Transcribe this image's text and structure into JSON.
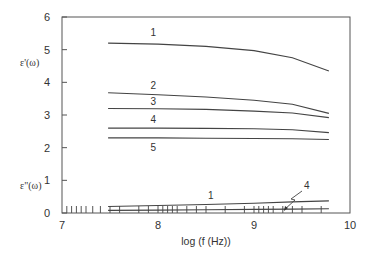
{
  "chart_data": {
    "type": "line",
    "title": "",
    "xlabel": "log (f (Hz))",
    "ylabel_real": "ε'(ω)",
    "ylabel_imag": "ε\"(ω)",
    "xlim": [
      7,
      10
    ],
    "ylim": [
      0,
      6
    ],
    "x_ticks": [
      "7",
      "8",
      "9",
      "10"
    ],
    "y_ticks": [
      "0",
      "1",
      "2",
      "3",
      "4",
      "5",
      "6"
    ],
    "grid": false,
    "legend": "inline curve labels",
    "x": [
      7.48,
      8.0,
      8.5,
      9.0,
      9.4,
      9.78
    ],
    "series": [
      {
        "name": "1",
        "part": "real",
        "values": [
          5.2,
          5.17,
          5.1,
          4.97,
          4.75,
          4.35
        ]
      },
      {
        "name": "2",
        "part": "real",
        "values": [
          3.68,
          3.62,
          3.55,
          3.45,
          3.33,
          3.05
        ]
      },
      {
        "name": "3",
        "part": "real",
        "values": [
          3.2,
          3.19,
          3.17,
          3.12,
          3.06,
          2.92
        ]
      },
      {
        "name": "4",
        "part": "real",
        "values": [
          2.6,
          2.6,
          2.59,
          2.58,
          2.55,
          2.46
        ]
      },
      {
        "name": "5",
        "part": "real",
        "values": [
          2.3,
          2.3,
          2.29,
          2.28,
          2.27,
          2.25
        ]
      },
      {
        "name": "1",
        "part": "imag",
        "values": [
          0.2,
          0.23,
          0.26,
          0.3,
          0.34,
          0.37
        ]
      },
      {
        "name": "4",
        "part": "imag",
        "values": [
          0.08,
          0.09,
          0.1,
          0.11,
          0.12,
          0.13
        ]
      }
    ],
    "measurement_ticks_log_f": [
      7.05,
      7.1,
      7.15,
      7.2,
      7.25,
      7.32,
      7.4,
      7.5,
      7.6,
      7.8,
      7.9,
      8.0,
      8.05,
      8.1,
      8.15,
      8.2,
      8.3,
      8.4,
      8.5,
      8.7,
      8.9,
      9.0,
      9.05,
      9.1,
      9.15,
      9.2,
      9.3,
      9.4,
      9.5,
      9.7
    ],
    "annotations": [
      {
        "text": "4",
        "note": "arrow pointing to ε'' curve 4 near log f = 9.3"
      }
    ]
  }
}
